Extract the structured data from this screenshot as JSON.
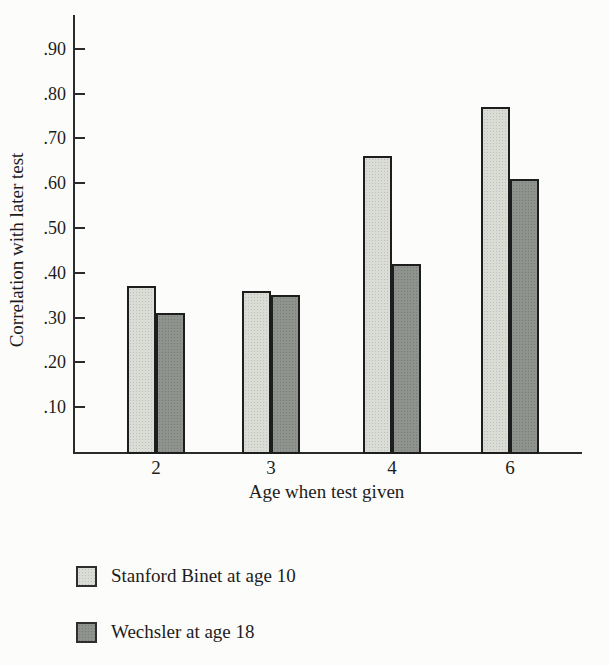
{
  "figure": {
    "background": "#fcfcfa",
    "axis_color": "#2b2b2b",
    "text_color": "#1c1c1c"
  },
  "chart_data": {
    "type": "bar",
    "title": "",
    "xlabel": "Age when test given",
    "ylabel": "Correlation with later test",
    "categories": [
      "2",
      "3",
      "4",
      "6"
    ],
    "series": [
      {
        "name": "Stanford Binet at age 10",
        "color": "#dadcd6",
        "values": [
          0.37,
          0.36,
          0.66,
          0.77
        ]
      },
      {
        "name": "Wechsler at age 18",
        "color": "#8f938e",
        "values": [
          0.31,
          0.35,
          0.42,
          0.61
        ]
      }
    ],
    "y_ticks": [
      ".10",
      ".20",
      ".30",
      ".40",
      ".50",
      ".60",
      ".70",
      ".80",
      ".90"
    ],
    "ylim": [
      0,
      0.97
    ],
    "grid": false,
    "legend_position": "below-chart"
  }
}
